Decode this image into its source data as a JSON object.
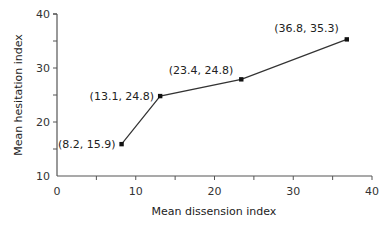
{
  "chart_data": {
    "type": "line",
    "title": "",
    "xlabel": "Mean dissension index",
    "ylabel": "Mean hesitation index",
    "xlim": [
      0,
      40
    ],
    "ylim": [
      10,
      40
    ],
    "x_ticks": [
      0,
      10,
      20,
      30,
      40
    ],
    "y_ticks": [
      10,
      20,
      30,
      40
    ],
    "grid": false,
    "legend": null,
    "series": [
      {
        "name": "hesitation vs dissension",
        "points": [
          {
            "x": 8.2,
            "y": 15.9,
            "label": "(8.2, 15.9)"
          },
          {
            "x": 13.1,
            "y": 24.8,
            "label": "(13.1, 24.8)"
          },
          {
            "x": 23.4,
            "y": 27.9,
            "label": "(23.4, 24.8)"
          },
          {
            "x": 36.8,
            "y": 35.3,
            "label": "(36.8, 35.3)"
          }
        ]
      }
    ]
  },
  "colors": {
    "axis": "#555555",
    "line": "#333333",
    "marker": "#111111"
  }
}
